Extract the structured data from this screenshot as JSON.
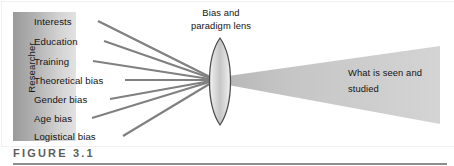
{
  "figure": {
    "number_label": "FIGURE 3.1",
    "accent_color": "#5d5d5d",
    "rule_color": "#8e8e8e"
  },
  "researcher_panel": {
    "axis_label": "Researcher",
    "fill_from": "#8c8c8c",
    "fill_to": "#d6d6d6",
    "items": [
      {
        "label": "Interests"
      },
      {
        "label": "Education"
      },
      {
        "label": "Training"
      },
      {
        "label": "Theoretical bias"
      },
      {
        "label": "Gender bias"
      },
      {
        "label": "Age bias"
      },
      {
        "label": "Logistical bias"
      }
    ]
  },
  "lens": {
    "caption_line1": "Bias and",
    "caption_line2": "paradigm lens",
    "outline_color": "#4a4a4a",
    "fill_color": "#d9d9d9"
  },
  "output": {
    "caption_line1": "What is seen and",
    "caption_line2": "studied",
    "beam_color": "#c9c9c9"
  },
  "rays": {
    "color": "#7f7f7f",
    "count": 7
  }
}
